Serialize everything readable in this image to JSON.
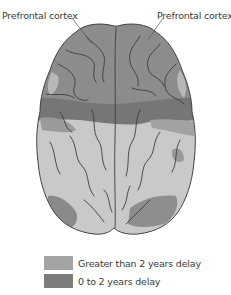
{
  "labels": {
    "left": "Prefrontal cortex",
    "right": "Prefrontal cortex"
  },
  "legend": {
    "items": [
      {
        "label": "Greater than 2 years delay",
        "color": "#a3a3a3"
      },
      {
        "label": "0 to 2 years delay",
        "color": "#7c7c7c"
      }
    ]
  },
  "colors": {
    "frontal": "#8c8c8c",
    "band": "#767676",
    "posterior": "#c9c9c9",
    "sulci": "#3c3c3c",
    "outline": "#444444"
  }
}
